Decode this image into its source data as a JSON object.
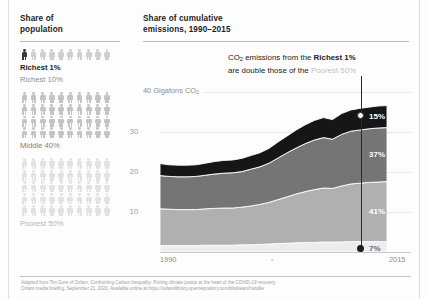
{
  "left_panel": {
    "heading_line1": "Share of",
    "heading_line2": "population",
    "groups": [
      {
        "key": "richest1",
        "label": "Richest 1%",
        "rows": 1,
        "per_row": 10,
        "color": "#cfcfcf",
        "highlight_color": "#3a3a3a",
        "highlight_count": 1
      },
      {
        "key": "richest10",
        "label": "Richest 10%",
        "rows": 0,
        "per_row": 10,
        "color": "#cfcfcf",
        "highlight_color": "",
        "highlight_count": 0
      },
      {
        "key": "middle40",
        "label": "Middle 40%",
        "rows": 4,
        "per_row": 10,
        "color": "#c4c4c4",
        "highlight_color": "",
        "highlight_count": 0
      },
      {
        "key": "poorest50",
        "label": "Poorest 50%",
        "rows": 5,
        "per_row": 10,
        "color": "#e2e2e2",
        "highlight_color": "",
        "highlight_count": 0
      }
    ]
  },
  "right_panel": {
    "heading_line1": "Share of cumulative",
    "heading_line2": "emissions, 1990–2015",
    "annotation": {
      "prefix": "CO",
      "sub": "2",
      "mid": " emissions from the ",
      "bold1": "Richest 1%",
      "line2_prefix": "are double those of the ",
      "faint": "Poorest 50%"
    },
    "axis_title_prefix": "40 Gigatons CO",
    "axis_title_sub": "2"
  },
  "chart_data": {
    "type": "area",
    "stacked": true,
    "title": "Share of cumulative emissions, 1990–2015",
    "xlabel": "",
    "ylabel": "Gigatons CO2",
    "xlim": [
      1990,
      2015
    ],
    "ylim": [
      0,
      40
    ],
    "yticks": [
      10,
      20,
      30,
      40
    ],
    "ytick_labels": [
      "10",
      "20",
      "30",
      "40"
    ],
    "xticks": [
      1990,
      2015
    ],
    "xtick_labels": [
      "1990",
      "2015"
    ],
    "grid": true,
    "legend": "none",
    "x": [
      1990,
      1991,
      1992,
      1993,
      1994,
      1995,
      1996,
      1997,
      1998,
      1999,
      2000,
      2001,
      2002,
      2003,
      2004,
      2005,
      2006,
      2007,
      2008,
      2009,
      2010,
      2011,
      2012,
      2013,
      2014,
      2015
    ],
    "series": [
      {
        "name": "Poorest 50%",
        "share_pct": 7,
        "label": "7%",
        "color": "#ededed",
        "values": [
          1.6,
          1.6,
          1.6,
          1.6,
          1.6,
          1.7,
          1.7,
          1.7,
          1.7,
          1.8,
          1.8,
          1.9,
          2.0,
          2.1,
          2.2,
          2.3,
          2.4,
          2.4,
          2.5,
          2.5,
          2.5,
          2.6,
          2.6,
          2.6,
          2.6,
          2.6
        ]
      },
      {
        "name": "Middle 40%",
        "share_pct": 41,
        "label": "41%",
        "color": "#b0b0b0",
        "values": [
          9.2,
          9.1,
          9.0,
          9.0,
          9.0,
          9.1,
          9.2,
          9.3,
          9.3,
          9.4,
          9.7,
          10.0,
          10.4,
          11.0,
          11.6,
          12.2,
          12.7,
          13.2,
          13.5,
          13.4,
          14.0,
          14.4,
          14.6,
          14.8,
          14.9,
          15.0
        ]
      },
      {
        "name": "Richest 10%",
        "share_pct": 37,
        "label": "37%",
        "color": "#757575",
        "values": [
          8.3,
          8.2,
          8.2,
          8.2,
          8.3,
          8.4,
          8.6,
          8.7,
          8.8,
          8.9,
          9.2,
          9.4,
          9.8,
          10.4,
          11.0,
          11.5,
          12.0,
          12.4,
          12.6,
          12.3,
          12.9,
          13.2,
          13.3,
          13.4,
          13.5,
          13.5
        ]
      },
      {
        "name": "Richest 1%",
        "share_pct": 15,
        "label": "15%",
        "color": "#161616",
        "values": [
          3.0,
          2.9,
          2.9,
          2.9,
          2.9,
          3.0,
          3.1,
          3.2,
          3.2,
          3.3,
          3.4,
          3.5,
          3.7,
          4.0,
          4.2,
          4.5,
          4.7,
          4.9,
          5.0,
          4.9,
          5.2,
          5.3,
          5.4,
          5.4,
          5.5,
          5.5
        ]
      }
    ],
    "totals": [
      22.1,
      21.8,
      21.7,
      21.7,
      21.8,
      22.2,
      22.6,
      22.9,
      23.0,
      23.4,
      24.1,
      24.8,
      25.9,
      27.5,
      29.0,
      30.5,
      31.8,
      32.9,
      33.6,
      33.1,
      34.6,
      35.5,
      35.9,
      36.2,
      36.5,
      36.6
    ],
    "callout": {
      "year": 2015,
      "top_marker_value": 31.1,
      "bottom_marker_value": 0.9
    }
  },
  "footer": {
    "line1": "Adapted from Tim Gore of Oxfam, Confronting Carbon Inequality: Putting climate justice at the heart of the COVID-19 recovery,",
    "line2": "Oxfam media briefing, September 21, 2020. Available online at https://oxfamilibrary.openrepository.com/bitstream/handle/"
  }
}
